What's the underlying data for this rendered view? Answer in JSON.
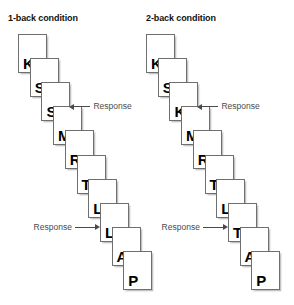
{
  "figure": {
    "background_color": "#ffffff",
    "card_border_color": "#6f6f6f",
    "annotation_color": "#4a4a4a"
  },
  "panels": [
    {
      "id": "1back",
      "title": "1-back condition",
      "cards": [
        {
          "letter": "K"
        },
        {
          "letter": "S"
        },
        {
          "letter": "S"
        },
        {
          "letter": "M"
        },
        {
          "letter": "R"
        },
        {
          "letter": "T"
        },
        {
          "letter": "L"
        },
        {
          "letter": "L"
        },
        {
          "letter": "A"
        },
        {
          "letter": "P"
        }
      ],
      "annotations": [
        {
          "label": "Response",
          "target_index": 2,
          "direction": "left"
        },
        {
          "label": "Response",
          "target_index": 7,
          "direction": "right"
        }
      ]
    },
    {
      "id": "2back",
      "title": "2-back condition",
      "cards": [
        {
          "letter": "K"
        },
        {
          "letter": "S"
        },
        {
          "letter": "K"
        },
        {
          "letter": "M"
        },
        {
          "letter": "R"
        },
        {
          "letter": "T"
        },
        {
          "letter": "L"
        },
        {
          "letter": "T"
        },
        {
          "letter": "A"
        },
        {
          "letter": "P"
        }
      ],
      "annotations": [
        {
          "label": "Response",
          "target_index": 2,
          "direction": "left"
        },
        {
          "label": "Response",
          "target_index": 7,
          "direction": "right"
        }
      ]
    }
  ]
}
